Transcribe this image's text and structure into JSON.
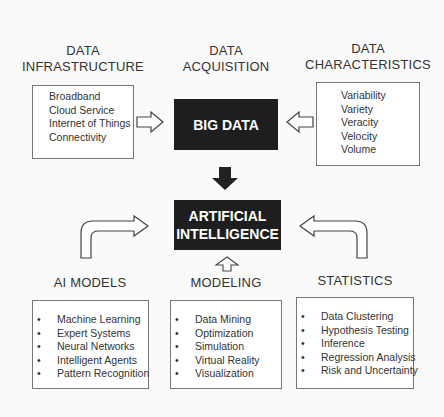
{
  "diagram": {
    "top_headings": {
      "infrastructure": [
        "DATA",
        "INFRASTRUCTURE"
      ],
      "acquisition": [
        "DATA",
        "ACQUISITION"
      ],
      "characteristics": [
        "DATA",
        "CHARACTERISTICS"
      ]
    },
    "infrastructure_items": [
      "Broadband",
      "Cloud Service",
      "Internet of Things",
      "Connectivity"
    ],
    "characteristics_items": [
      "Variability",
      "Variety",
      "Veracity",
      "Velocity",
      "Volume"
    ],
    "big_data_label": "BIG DATA",
    "ai_label": [
      "ARTIFICIAL",
      "INTELLIGENCE"
    ],
    "bottom_headings": {
      "ai_models": "AI MODELS",
      "modeling": "MODELING",
      "statistics": "STATISTICS"
    },
    "ai_models_items": [
      "Machine Learning",
      "Expert Systems",
      "Neural Networks",
      "Intelligent Agents",
      "Pattern Recognition"
    ],
    "modeling_items": [
      "Data Mining",
      "Optimization",
      "Simulation",
      "Virtual Reality",
      "Visualization"
    ],
    "statistics_items": [
      "Data Clustering",
      "Hypothesis Testing",
      "Inference",
      "Regression Analysis",
      "Risk and Uncertainty"
    ],
    "colors": {
      "dark_box": "#1e1e1e",
      "background": "#fafafa",
      "border": "#777777"
    }
  }
}
